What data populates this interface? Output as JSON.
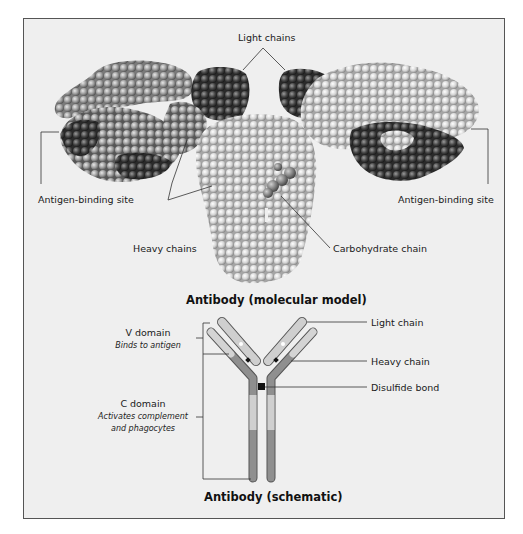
{
  "molecular_model": {
    "title": "Antibody (molecular model)",
    "labels": {
      "light_chains": "Light chains",
      "antigen_site_left": "Antigen-binding site",
      "antigen_site_right": "Antigen-binding site",
      "heavy_chains": "Heavy chains",
      "carbohydrate": "Carbohydrate chain"
    }
  },
  "schematic": {
    "title": "Antibody (schematic)",
    "v_domain": {
      "name": "V domain",
      "desc": "Binds to antigen"
    },
    "c_domain": {
      "name": "C domain",
      "desc_line1": "Activates complement",
      "desc_line2": "and phagocytes"
    },
    "labels": {
      "light_chain": "Light chain",
      "heavy_chain": "Heavy chain",
      "disulfide": "Disulfide bond"
    }
  },
  "colors": {
    "background": "#efefef",
    "border": "#555555",
    "sphere_dark": "#3a3a3a",
    "sphere_mid": "#8a8a8a",
    "sphere_light": "#c8c8c8",
    "chain_dark": "#8f8f8f",
    "chain_light": "#cfcfcf",
    "bond": "#111111"
  }
}
